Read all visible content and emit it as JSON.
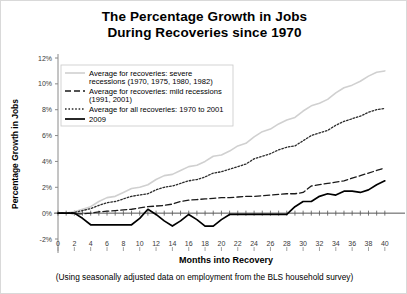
{
  "chart_data": {
    "type": "line",
    "title": "The Percentage Growth in Jobs During Recoveries since 1970",
    "title_line1": "The Percentage Growth in Jobs",
    "title_line2": "During Recoveries since 1970",
    "xlabel": "Months into Recovery",
    "ylabel": "Percentage Growth in Jobs",
    "footnote": "(Using seasonally adjusted data on employment from the BLS household survey)",
    "xlim": [
      0,
      41
    ],
    "ylim": [
      -2,
      12
    ],
    "xticks": [
      0,
      2,
      4,
      6,
      8,
      10,
      12,
      14,
      16,
      18,
      20,
      22,
      24,
      26,
      28,
      30,
      32,
      34,
      36,
      38,
      40
    ],
    "xtick_labels": [
      "0",
      "2",
      "4",
      "6",
      "8",
      "10",
      "12",
      "14",
      "16",
      "18",
      "20",
      "22",
      "24",
      "26",
      "28",
      "30",
      "32",
      "34",
      "36",
      "38",
      "40"
    ],
    "yticks": [
      -2,
      0,
      2,
      4,
      6,
      8,
      10,
      12
    ],
    "ytick_labels": [
      "-2%",
      "0%",
      "2%",
      "4%",
      "6%",
      "8%",
      "10%",
      "12%"
    ],
    "grid": false,
    "legend_position": "upper-left",
    "x": [
      0,
      1,
      2,
      3,
      4,
      5,
      6,
      7,
      8,
      9,
      10,
      11,
      12,
      13,
      14,
      15,
      16,
      17,
      18,
      19,
      20,
      21,
      22,
      23,
      24,
      25,
      26,
      27,
      28,
      29,
      30,
      31,
      32,
      33,
      34,
      35,
      36,
      37,
      38,
      39,
      40
    ],
    "series": [
      {
        "name": "Average for recoveries: severe recessions (1970, 1975, 1980, 1982)",
        "label_line1": "Average for recoveries: severe",
        "label_line2": "recessions (1970, 1975, 1980, 1982)",
        "color": "#d0d0d0",
        "dash": "none",
        "width": 1.6,
        "values": [
          0,
          0,
          0.1,
          0.3,
          0.5,
          0.9,
          1.2,
          1.3,
          1.6,
          1.9,
          2.0,
          2.2,
          2.6,
          2.9,
          3.0,
          3.3,
          3.6,
          3.7,
          4.0,
          4.4,
          4.5,
          4.8,
          5.2,
          5.4,
          5.9,
          6.3,
          6.5,
          6.9,
          7.2,
          7.4,
          7.9,
          8.3,
          8.5,
          8.8,
          9.3,
          9.7,
          9.9,
          10.2,
          10.6,
          10.9,
          11.0
        ]
      },
      {
        "name": "Average for recoveries: mild recessions (1991, 2001)",
        "label_line1": "Average for recoveries: mild recessions",
        "label_line2": "(1991, 2001)",
        "color": "#1a1a1a",
        "dash": "6,3",
        "width": 1.3,
        "values": [
          0,
          0,
          -0.05,
          -0.05,
          0,
          0.1,
          0.15,
          0.2,
          0.25,
          0.3,
          0.4,
          0.5,
          0.55,
          0.6,
          0.7,
          0.9,
          1.0,
          1.05,
          1.1,
          1.15,
          1.2,
          1.2,
          1.25,
          1.3,
          1.3,
          1.35,
          1.4,
          1.45,
          1.5,
          1.5,
          1.6,
          2.1,
          2.2,
          2.3,
          2.4,
          2.5,
          2.7,
          2.9,
          3.1,
          3.3,
          3.5
        ]
      },
      {
        "name": "Average for all recoveries: 1970 to 2001",
        "label_line1": "Average for all recoveries: 1970 to 2001",
        "label_line2": "",
        "color": "#2b2b2b",
        "dash": "1.6,1.8",
        "width": 1.3,
        "values": [
          0,
          0,
          0.05,
          0.2,
          0.35,
          0.6,
          0.8,
          0.9,
          1.1,
          1.3,
          1.4,
          1.5,
          1.8,
          2.0,
          2.1,
          2.3,
          2.5,
          2.6,
          2.8,
          3.1,
          3.2,
          3.4,
          3.6,
          3.8,
          4.2,
          4.4,
          4.6,
          4.9,
          5.1,
          5.2,
          5.6,
          6.0,
          6.2,
          6.4,
          6.8,
          7.1,
          7.3,
          7.5,
          7.8,
          8.0,
          8.1
        ]
      },
      {
        "name": "2009",
        "label_line1": "2009",
        "label_line2": "",
        "color": "#000000",
        "dash": "none",
        "width": 1.7,
        "values": [
          0,
          0,
          0,
          -0.4,
          -0.9,
          -0.9,
          -0.9,
          -0.9,
          -0.9,
          -0.9,
          -0.4,
          0.3,
          -0.1,
          -0.6,
          -1.0,
          -0.6,
          -0.1,
          -0.5,
          -1.0,
          -1.0,
          -0.5,
          -0.1,
          -0.1,
          -0.1,
          -0.1,
          -0.1,
          -0.1,
          -0.1,
          -0.1,
          0.5,
          0.9,
          0.9,
          1.3,
          1.5,
          1.4,
          1.7,
          1.7,
          1.6,
          1.8,
          2.2,
          2.5
        ]
      }
    ]
  }
}
